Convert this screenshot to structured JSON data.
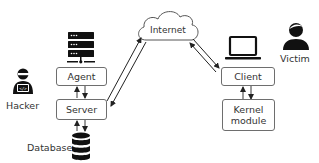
{
  "diagram": {
    "nodes": {
      "internet": {
        "label": "Internet"
      },
      "agent": {
        "label": "Agent"
      },
      "server": {
        "label": "Server"
      },
      "client": {
        "label": "Client"
      },
      "kernel_module": {
        "label": "Kernel\nmodule",
        "line1": "Kernel",
        "line2": "module"
      },
      "hacker": {
        "label": "Hacker"
      },
      "victim": {
        "label": "Victim"
      },
      "database": {
        "label": "Database"
      }
    },
    "icons": {
      "server_rack": "server-rack-icon",
      "laptop": "laptop-icon",
      "hacker": "hacker-person-icon",
      "victim": "person-icon",
      "database": "database-icon",
      "cloud": "cloud-icon"
    },
    "edges": [
      {
        "from": "server",
        "to": "internet",
        "type": "bidirectional"
      },
      {
        "from": "internet",
        "to": "client",
        "type": "bidirectional"
      },
      {
        "from": "agent",
        "to": "server",
        "type": "bidirectional"
      },
      {
        "from": "client",
        "to": "kernel_module",
        "type": "bidirectional"
      },
      {
        "from": "server",
        "to": "database",
        "type": "bidirectional"
      }
    ],
    "colors": {
      "line": "#2a2a2a",
      "box_border": "#6e6e6e",
      "icon": "#111111"
    }
  }
}
